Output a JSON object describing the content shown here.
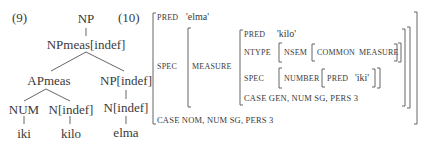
{
  "examples": {
    "tree_number": "(9)",
    "fstructure_number": "(10)"
  },
  "tree": {
    "root": "NP",
    "level1": "NPmeas[indef]",
    "level2_left": "APmeas",
    "level2_right": "NP[indef]",
    "level3_num": "NUM",
    "level3_n_left": "N[indef]",
    "level3_n_right": "N[indef]",
    "leaf_iki": "iki",
    "leaf_kilo": "kilo",
    "leaf_elma": "elma"
  },
  "fstructure": {
    "pred_attr": "PRED",
    "pred_val": "'elma'",
    "spec_attr": "SPEC",
    "measure_attr": "MEASURE",
    "inner": {
      "pred_attr": "PRED",
      "pred_val": "'kilo'",
      "ntype_attr": "NTYPE",
      "nsem_attr": "NSEM",
      "common_attr": "COMMON",
      "common_val": "MEASURE",
      "spec_attr": "SPEC",
      "number_attr": "NUMBER",
      "number_pred_attr": "PRED",
      "number_pred_val": "'iki'",
      "case_line": "CASE GEN, NUM SG, PERS 3"
    },
    "case_line": "CASE NOM, NUM SG, PERS 3"
  }
}
